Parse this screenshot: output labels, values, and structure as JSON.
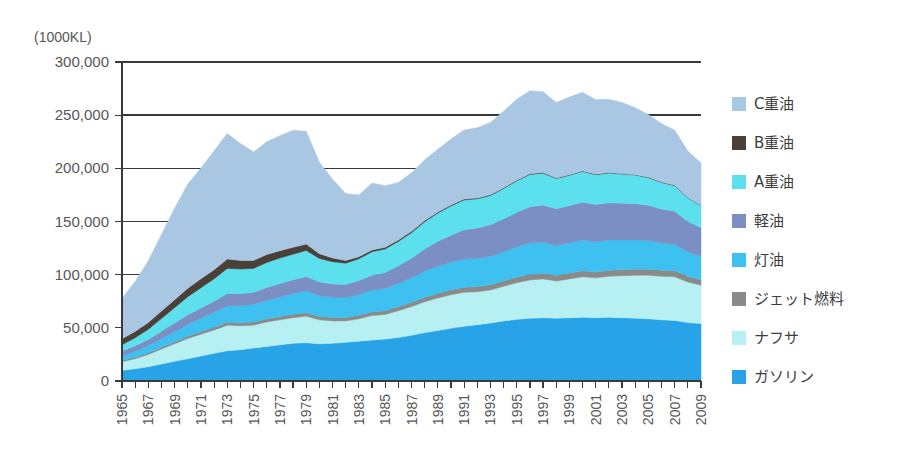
{
  "chart_data": {
    "type": "area",
    "stacked": true,
    "title": "",
    "subtitle": "",
    "xlabel": "",
    "ylabel": "(1000KL)",
    "unit_label": "(1000KL)",
    "ylim": [
      0,
      300000
    ],
    "ytick_values": [
      0,
      50000,
      100000,
      150000,
      200000,
      250000,
      300000
    ],
    "ytick_labels": [
      "0",
      "50,000",
      "100,000",
      "150,000",
      "200,000",
      "250,000",
      "300,000"
    ],
    "grid": true,
    "legend_position": "right",
    "x": [
      1965,
      1966,
      1967,
      1968,
      1969,
      1970,
      1971,
      1972,
      1973,
      1974,
      1975,
      1976,
      1977,
      1978,
      1979,
      1980,
      1981,
      1982,
      1983,
      1984,
      1985,
      1986,
      1987,
      1988,
      1989,
      1990,
      1991,
      1992,
      1993,
      1994,
      1995,
      1996,
      1997,
      1998,
      1999,
      2000,
      2001,
      2002,
      2003,
      2004,
      2005,
      2006,
      2007,
      2008,
      2009
    ],
    "xtick_labels": [
      "1965",
      "1967",
      "1969",
      "1971",
      "1973",
      "1975",
      "1977",
      "1979",
      "1981",
      "1983",
      "1985",
      "1987",
      "1989",
      "1991",
      "1993",
      "1995",
      "1997",
      "1999",
      "2001",
      "2003",
      "2005",
      "2007",
      "2009"
    ],
    "series": [
      {
        "name": "ガソリン",
        "legend_label": "ガソリン",
        "color": "#29a3e8",
        "values": [
          10000,
          11500,
          13500,
          16000,
          18500,
          21000,
          23500,
          26000,
          28500,
          29500,
          31000,
          32500,
          34000,
          35500,
          36000,
          35000,
          35500,
          36500,
          37500,
          38500,
          39500,
          41000,
          43000,
          45500,
          47500,
          49500,
          51500,
          53000,
          54500,
          56500,
          58000,
          59000,
          59500,
          59000,
          59500,
          60000,
          59500,
          60000,
          59500,
          59000,
          58500,
          57500,
          57000,
          55000,
          54000
        ]
      },
      {
        "name": "ナフサ",
        "legend_label": "ナフサ",
        "color": "#b6f0f2",
        "values": [
          8000,
          9500,
          11500,
          14000,
          16500,
          19000,
          20500,
          22000,
          24000,
          22500,
          21500,
          23000,
          23500,
          24000,
          25000,
          22500,
          21000,
          20000,
          21000,
          23000,
          23000,
          25000,
          27000,
          29000,
          30500,
          31500,
          32000,
          31000,
          31000,
          32500,
          34500,
          36000,
          36500,
          35000,
          36500,
          38000,
          37500,
          38500,
          39500,
          40500,
          41000,
          41000,
          41000,
          38000,
          36000
        ]
      },
      {
        "name": "ジェット燃料",
        "legend_label": "ジェット燃料",
        "color": "#8a8a8a",
        "values": [
          1200,
          1400,
          1600,
          1800,
          2000,
          2200,
          2400,
          2600,
          2800,
          2800,
          2900,
          3000,
          3100,
          3200,
          3300,
          3200,
          3200,
          3300,
          3400,
          3500,
          3600,
          3800,
          4000,
          4200,
          4400,
          4600,
          4700,
          4800,
          4900,
          5000,
          5200,
          5300,
          5400,
          5400,
          5500,
          5600,
          5500,
          5600,
          5600,
          5700,
          5700,
          5700,
          5700,
          5500,
          5300
        ]
      },
      {
        "name": "灯油",
        "legend_label": "灯油",
        "color": "#3ec1f0",
        "values": [
          4500,
          5500,
          6500,
          8000,
          9500,
          11000,
          12500,
          14000,
          15500,
          16000,
          16500,
          17500,
          18500,
          19500,
          20500,
          19500,
          19000,
          18500,
          19500,
          20500,
          21000,
          22000,
          23000,
          24500,
          25500,
          26000,
          26500,
          26500,
          27000,
          27500,
          28500,
          29500,
          29000,
          28000,
          28500,
          29000,
          28500,
          28500,
          28000,
          27500,
          27000,
          25500,
          25000,
          23000,
          22000
        ]
      },
      {
        "name": "軽油",
        "legend_label": "軽油",
        "color": "#7b8fc4",
        "values": [
          4500,
          5200,
          6000,
          7000,
          8000,
          9000,
          9800,
          10500,
          11500,
          11500,
          11500,
          12000,
          12500,
          13000,
          13500,
          13000,
          12500,
          12500,
          13000,
          14000,
          15000,
          16500,
          18500,
          21000,
          23500,
          25500,
          27500,
          28500,
          29500,
          31000,
          32500,
          34000,
          35000,
          34500,
          35000,
          35500,
          35000,
          35000,
          34500,
          34000,
          33000,
          32000,
          31000,
          28500,
          27000
        ]
      },
      {
        "name": "A重油",
        "legend_label": "A重油",
        "color": "#5ce0ee",
        "values": [
          6000,
          7500,
          9500,
          12000,
          14500,
          17000,
          19000,
          21000,
          23500,
          23000,
          22500,
          23500,
          24000,
          24000,
          24500,
          22000,
          21000,
          20000,
          20500,
          22000,
          22000,
          23000,
          24000,
          25500,
          26500,
          27500,
          28000,
          27500,
          27500,
          28500,
          29500,
          30500,
          30000,
          28500,
          28500,
          29000,
          28000,
          28000,
          27500,
          27000,
          26000,
          25000,
          24000,
          22000,
          20500
        ]
      },
      {
        "name": "B重油",
        "legend_label": "B重油",
        "color": "#4a4038",
        "values": [
          5500,
          6000,
          6500,
          7000,
          7500,
          8000,
          8500,
          8500,
          9000,
          8000,
          7500,
          7500,
          7000,
          6500,
          6000,
          4500,
          3500,
          2500,
          2000,
          1800,
          1600,
          1400,
          1300,
          1200,
          1100,
          1000,
          900,
          850,
          800,
          750,
          700,
          650,
          600,
          550,
          500,
          480,
          450,
          420,
          400,
          380,
          350,
          330,
          300,
          280,
          250
        ]
      },
      {
        "name": "C重油",
        "legend_label": "C重油",
        "color": "#a9c6e3",
        "values": [
          38000,
          47000,
          58000,
          72000,
          86000,
          98000,
          104000,
          112000,
          118000,
          110000,
          102000,
          106000,
          108000,
          110000,
          106000,
          86000,
          74000,
          63000,
          58000,
          63000,
          58000,
          54000,
          55000,
          57000,
          59000,
          62000,
          65000,
          66000,
          68000,
          72000,
          76000,
          78000,
          76000,
          71000,
          73000,
          74000,
          70000,
          69000,
          67000,
          63000,
          59000,
          55000,
          52000,
          44000,
          40000
        ]
      }
    ],
    "legend_order_top_to_bottom": [
      "C重油",
      "B重油",
      "A重油",
      "軽油",
      "灯油",
      "ジェット燃料",
      "ナフサ",
      "ガソリン"
    ]
  },
  "colors": {
    "background": "#ffffff",
    "axis": "#3a3a3a",
    "text": "#575757",
    "c_heavy_oil": "#a9c6e3",
    "b_heavy_oil": "#4a4038",
    "a_heavy_oil": "#5ce0ee",
    "gas_oil": "#7b8fc4",
    "kerosene": "#3ec1f0",
    "jet_fuel": "#8a8a8a",
    "naphtha": "#b6f0f2",
    "gasoline": "#29a3e8"
  }
}
